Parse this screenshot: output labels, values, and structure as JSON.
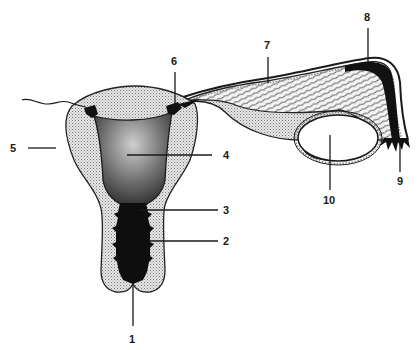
{
  "diagram": {
    "labels": [
      {
        "id": "1",
        "text": "1",
        "target": "external-os"
      },
      {
        "id": "2",
        "text": "2",
        "target": "cervical-canal"
      },
      {
        "id": "3",
        "text": "3",
        "target": "internal-os"
      },
      {
        "id": "4",
        "text": "4",
        "target": "uterine-cavity"
      },
      {
        "id": "5",
        "text": "5",
        "target": "uterine-wall"
      },
      {
        "id": "6",
        "text": "6",
        "target": "tubal-ostium"
      },
      {
        "id": "7",
        "text": "7",
        "target": "fallopian-tube"
      },
      {
        "id": "8",
        "text": "8",
        "target": "ampulla"
      },
      {
        "id": "9",
        "text": "9",
        "target": "fimbriae"
      },
      {
        "id": "10",
        "text": "10",
        "target": "ovary"
      }
    ],
    "colors": {
      "ink": "#1a1a1a",
      "stipple_light": "#d8d8d8",
      "cavity_dark": "#3a3a3a",
      "background": "#ffffff"
    }
  }
}
